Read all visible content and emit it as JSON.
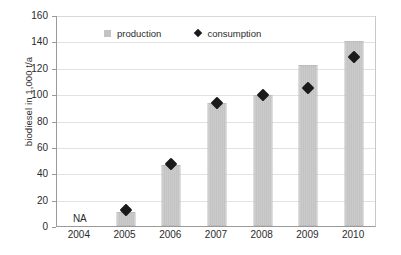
{
  "chart_data": {
    "type": "bar",
    "title": "",
    "subtitle": "",
    "xlabel": "",
    "ylabel": "biodiesel in 1,000  t/a",
    "categories": [
      "2004",
      "2005",
      "2006",
      "2007",
      "2008",
      "2009",
      "2010"
    ],
    "series": [
      {
        "name": "production",
        "marker": "square",
        "color": "#c3c3c3",
        "values": [
          null,
          11,
          46,
          93,
          99,
          122,
          140
        ]
      },
      {
        "name": "consumption",
        "marker": "diamond",
        "color": "#1a1a1a",
        "values": [
          null,
          12,
          47,
          93,
          99,
          105,
          128
        ]
      }
    ],
    "ylim": [
      0,
      160
    ],
    "yticks": [
      0,
      20,
      40,
      60,
      80,
      100,
      120,
      140,
      160
    ],
    "ytick_labels": [
      "0",
      "20",
      "40",
      "60",
      "80",
      "100",
      "120",
      "140",
      "160"
    ],
    "grid": "horizontal",
    "legend_position": "top-inside",
    "annotations": [
      {
        "category": "2004",
        "text": "NA"
      }
    ]
  },
  "legend": {
    "entries": [
      {
        "label": "production",
        "icon": "square-marker"
      },
      {
        "label": "consumption",
        "icon": "diamond-marker"
      }
    ]
  },
  "colors": {
    "bar_fill": "#c3c3c3",
    "marker_fill": "#1a1a1a",
    "gridline": "#e2e2e2",
    "axis": "#9a9a9a",
    "text": "#2b2b2b",
    "background": "#ffffff"
  }
}
